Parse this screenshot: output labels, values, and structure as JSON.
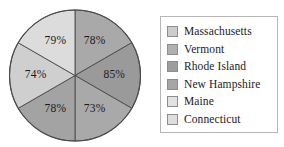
{
  "chart_data": {
    "type": "pie",
    "title": "",
    "subtitle": "",
    "xlabel": "",
    "ylabel": "",
    "grid": false,
    "legend_position": "right",
    "categories": [
      "Massachusetts",
      "Vermont",
      "Rhode Island",
      "New Hampshire",
      "Maine",
      "Connecticut"
    ],
    "values": [
      78,
      85,
      73,
      78,
      74,
      79
    ],
    "data_labels": [
      "78%",
      "85%",
      "73%",
      "78%",
      "74%",
      "79%"
    ],
    "slice_colors": [
      "#a9a9a9",
      "#9a9a9a",
      "#a9a9a9",
      "#a3a3a3",
      "#cfcfcf",
      "#dcdcdc"
    ],
    "slice_angles_deg": [
      60,
      60,
      60,
      60,
      60,
      60
    ],
    "note": "Six equal-area wedges; percentage labels are independent values, not slice proportions."
  },
  "pie": {
    "slices": [
      {
        "label": "78%",
        "color": "#a9a9a9",
        "state": "Massachusetts"
      },
      {
        "label": "85%",
        "color": "#9a9a9a",
        "state": "Vermont"
      },
      {
        "label": "73%",
        "color": "#a9a9a9",
        "state": "Rhode Island"
      },
      {
        "label": "78%",
        "color": "#a3a3a3",
        "state": "New Hampshire"
      },
      {
        "label": "74%",
        "color": "#cfcfcf",
        "state": "Maine"
      },
      {
        "label": "79%",
        "color": "#dcdcdc",
        "state": "Connecticut"
      }
    ],
    "outline_color": "#4a4a4a"
  },
  "legend": {
    "items": [
      {
        "label": "Massachusetts",
        "color": "#cdcdcd"
      },
      {
        "label": "Vermont",
        "color": "#b0b0b0"
      },
      {
        "label": "Rhode Island",
        "color": "#9d9d9d"
      },
      {
        "label": "New Hampshire",
        "color": "#a6a6a6"
      },
      {
        "label": "Maine",
        "color": "#e2e2e2"
      },
      {
        "label": "Connecticut",
        "color": "#dedede"
      }
    ]
  }
}
